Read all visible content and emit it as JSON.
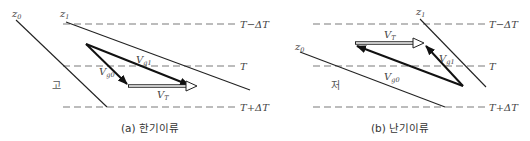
{
  "panels": [
    {
      "id": "a",
      "caption": "(a) 한기이류",
      "region_label": "고",
      "isotherms": [
        {
          "label": "T−ΔT"
        },
        {
          "label": "T"
        },
        {
          "label": "T+ΔT"
        }
      ],
      "heights": [
        {
          "label": "z",
          "sub": "0"
        },
        {
          "label": "z",
          "sub": "1"
        }
      ],
      "vectors": {
        "vg0": {
          "label": "V",
          "sub": "g0"
        },
        "vg1": {
          "label": "V",
          "sub": "g1"
        },
        "vt": {
          "label": "V",
          "sub": "T"
        }
      }
    },
    {
      "id": "b",
      "caption": "(b) 난기이류",
      "region_label": "저",
      "isotherms": [
        {
          "label": "T−ΔT"
        },
        {
          "label": "T"
        },
        {
          "label": "T+ΔT"
        }
      ],
      "heights": [
        {
          "label": "z",
          "sub": "0"
        },
        {
          "label": "z",
          "sub": "1"
        }
      ],
      "vectors": {
        "vg0": {
          "label": "V",
          "sub": "g0"
        },
        "vg1": {
          "label": "V",
          "sub": "g1"
        },
        "vt": {
          "label": "V",
          "sub": "T"
        }
      }
    }
  ]
}
